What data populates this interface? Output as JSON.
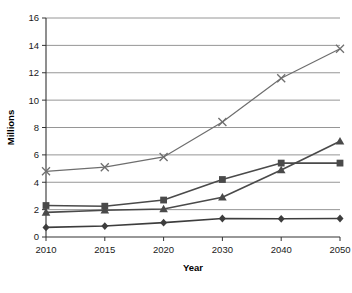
{
  "chart_data": {
    "type": "line",
    "title": "",
    "xlabel": "Year",
    "ylabel": "Millions",
    "categories": [
      "2010",
      "2015",
      "2020",
      "2030",
      "2040",
      "2050"
    ],
    "x": [
      2010,
      2015,
      2020,
      2030,
      2040,
      2050
    ],
    "ylim": [
      0,
      16
    ],
    "yticks": [
      0,
      2,
      4,
      6,
      8,
      10,
      12,
      14,
      16
    ],
    "ytick_labels": [
      "0",
      "2",
      "4",
      "6",
      "8",
      "10",
      "12",
      "14",
      "16"
    ],
    "grid": "horizontal",
    "legend": "none",
    "series": [
      {
        "name": "series-x",
        "marker": "cross",
        "color": "#6e6e6e",
        "values": [
          4.8,
          5.1,
          5.85,
          8.4,
          11.6,
          13.75
        ]
      },
      {
        "name": "series-square",
        "marker": "square",
        "color": "#4a4a4a",
        "values": [
          2.3,
          2.25,
          2.7,
          4.2,
          5.4,
          5.4
        ]
      },
      {
        "name": "series-triangle",
        "marker": "triangle",
        "color": "#4a4a4a",
        "values": [
          1.8,
          1.95,
          2.05,
          2.9,
          4.9,
          7.0
        ]
      },
      {
        "name": "series-diamond",
        "marker": "diamond",
        "color": "#3d3d3d",
        "values": [
          0.7,
          0.8,
          1.05,
          1.35,
          1.33,
          1.35
        ]
      }
    ]
  }
}
